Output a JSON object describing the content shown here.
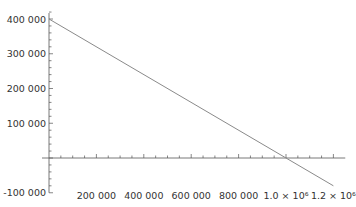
{
  "chart_data": {
    "type": "line",
    "title": "",
    "xlabel": "",
    "ylabel": "",
    "xlim": [
      0,
      1250000
    ],
    "ylim": [
      -100000,
      400000
    ],
    "grid": false,
    "legend": null,
    "x_ticks": [
      200000,
      400000,
      600000,
      800000,
      1000000,
      1200000
    ],
    "x_tick_labels": [
      "200 000",
      "400 000",
      "600 000",
      "800 000",
      "1.0 × 10⁶",
      "1.2 × 10⁶"
    ],
    "y_ticks": [
      -100000,
      100000,
      200000,
      300000,
      400000
    ],
    "y_tick_labels": [
      "-100 000",
      "100 000",
      "200 000",
      "300 000",
      "400 000"
    ],
    "series": [
      {
        "name": "line",
        "color": "#8a8a8a",
        "x": [
          0,
          1200000
        ],
        "y": [
          400000,
          -80000
        ]
      }
    ]
  }
}
